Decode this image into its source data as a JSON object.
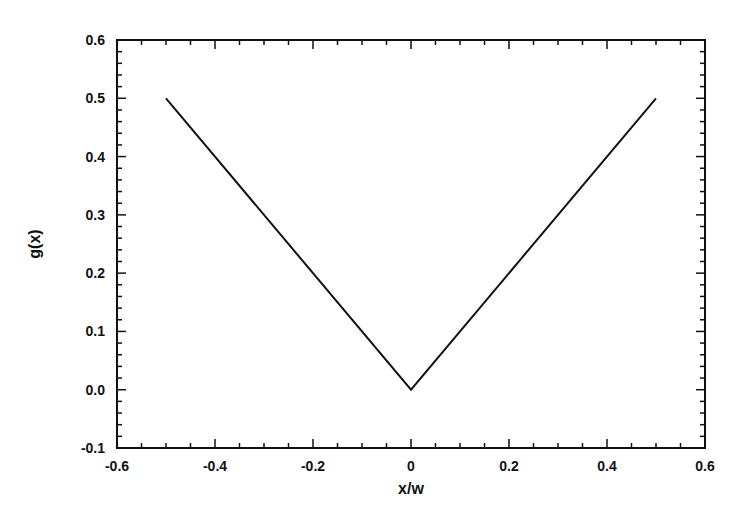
{
  "chart_data": {
    "type": "line",
    "title": "",
    "xlabel": "x/w",
    "ylabel": "g(x)",
    "xlim": [
      -0.6,
      0.6
    ],
    "ylim": [
      -0.1,
      0.6
    ],
    "grid": false,
    "legend": null,
    "x_ticks": [
      "-0.6",
      "-0.4",
      "-0.2",
      "0",
      "0.2",
      "0.4",
      "0.6"
    ],
    "y_ticks": [
      "-0.1",
      "0.0",
      "0.1",
      "0.2",
      "0.3",
      "0.4",
      "0.5",
      "0.6"
    ],
    "series": [
      {
        "name": "g(x) = |x|",
        "x": [
          -0.5,
          0.0,
          0.5
        ],
        "y": [
          0.5,
          0.0,
          0.5
        ],
        "color": "#111111"
      }
    ]
  },
  "layout": {
    "plot": {
      "left": 117,
      "right": 705,
      "top": 40,
      "bottom": 448
    },
    "line_color": "#111111",
    "axis_color": "#111111"
  }
}
